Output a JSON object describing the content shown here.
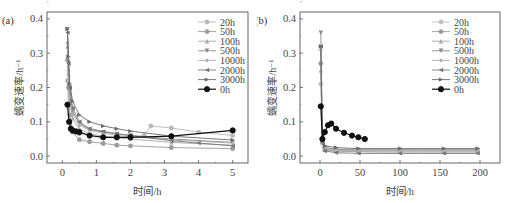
{
  "chart_data": [
    {
      "panel_label": "(a)",
      "type": "line",
      "title": "",
      "xlabel": "时间/h",
      "ylabel": "蠕变速率/h⁻¹",
      "xlim": [
        -0.45,
        5.45
      ],
      "ylim": [
        -0.02,
        0.42
      ],
      "xticks": [
        0,
        1,
        2,
        3,
        4,
        5
      ],
      "xtick_labels": [
        "0",
        "1",
        "2",
        "3",
        "4",
        "5"
      ],
      "yticks": [
        0.0,
        0.1,
        0.2,
        0.3,
        0.4
      ],
      "ytick_labels": [
        "0.0",
        "0.1",
        "0.2",
        "0.3",
        "0.4"
      ],
      "grid": false,
      "legend_position": "upper right",
      "series": [
        {
          "name": "20h",
          "color": "#b8b8b8",
          "marker": "circle",
          "x": [
            0.15,
            0.18,
            0.22,
            0.3,
            0.5,
            0.8,
            1.2,
            1.6,
            2.0,
            2.4,
            2.6,
            3.2,
            4.0,
            5.0
          ],
          "y": [
            0.22,
            0.15,
            0.1,
            0.075,
            0.065,
            0.06,
            0.055,
            0.055,
            0.055,
            0.06,
            0.088,
            0.082,
            0.07,
            0.06
          ]
        },
        {
          "name": "50h",
          "color": "#9a9a9a",
          "marker": "circle",
          "x": [
            0.15,
            0.18,
            0.22,
            0.3,
            0.5,
            0.8,
            1.2,
            1.6,
            2.0,
            3.2,
            5.0
          ],
          "y": [
            0.28,
            0.2,
            0.12,
            0.07,
            0.048,
            0.042,
            0.037,
            0.032,
            0.03,
            0.025,
            0.022
          ]
        },
        {
          "name": "100h",
          "color": "#a8a8a8",
          "marker": "triangle-up",
          "x": [
            0.15,
            0.18,
            0.22,
            0.3,
            0.5,
            0.8,
            1.2,
            1.6,
            2.0,
            3.2,
            5.0
          ],
          "y": [
            0.32,
            0.24,
            0.16,
            0.11,
            0.08,
            0.065,
            0.058,
            0.053,
            0.05,
            0.04,
            0.032
          ]
        },
        {
          "name": "500h",
          "color": "#888888",
          "marker": "triangle-down",
          "x": [
            0.15,
            0.18,
            0.22,
            0.3,
            0.5,
            0.8,
            1.2,
            1.6,
            2.0,
            3.2,
            5.0
          ],
          "y": [
            0.37,
            0.27,
            0.19,
            0.13,
            0.095,
            0.078,
            0.07,
            0.065,
            0.06,
            0.05,
            0.04
          ]
        },
        {
          "name": "1000h",
          "color": "#b0b0b0",
          "marker": "diamond",
          "x": [
            0.15,
            0.18,
            0.22,
            0.3,
            0.5,
            0.8,
            1.2,
            1.6,
            2.0,
            3.2,
            5.0
          ],
          "y": [
            0.33,
            0.25,
            0.17,
            0.12,
            0.09,
            0.075,
            0.067,
            0.06,
            0.057,
            0.047,
            0.038
          ]
        },
        {
          "name": "2000h",
          "color": "#777777",
          "marker": "triangle-left",
          "x": [
            0.15,
            0.18,
            0.22,
            0.3,
            0.5,
            0.8,
            1.2,
            1.6,
            2.0,
            3.2,
            4.0,
            5.0
          ],
          "y": [
            0.36,
            0.27,
            0.2,
            0.14,
            0.1,
            0.08,
            0.072,
            0.065,
            0.06,
            0.045,
            0.038,
            0.03
          ]
        },
        {
          "name": "3000h",
          "color": "#6a6a6a",
          "marker": "triangle-right",
          "x": [
            0.15,
            0.18,
            0.22,
            0.3,
            0.5,
            0.8,
            1.2,
            1.6,
            2.0,
            3.2,
            5.0
          ],
          "y": [
            0.37,
            0.29,
            0.21,
            0.16,
            0.12,
            0.1,
            0.088,
            0.08,
            0.073,
            0.058,
            0.047
          ]
        },
        {
          "name": "0h",
          "color": "#111111",
          "marker": "circle-filled",
          "x": [
            0.15,
            0.2,
            0.25,
            0.3,
            0.4,
            0.5,
            0.8,
            1.2,
            1.6,
            2.0,
            3.2,
            5.0
          ],
          "y": [
            0.15,
            0.1,
            0.08,
            0.075,
            0.072,
            0.07,
            0.06,
            0.055,
            0.055,
            0.055,
            0.058,
            0.075
          ]
        }
      ]
    },
    {
      "panel_label": "(b)",
      "type": "line",
      "title": "",
      "xlabel": "时间/h",
      "ylabel": "蠕变速率/h⁻¹",
      "xlim": [
        -25,
        225
      ],
      "ylim": [
        -0.02,
        0.42
      ],
      "xticks": [
        0,
        50,
        100,
        150,
        200
      ],
      "xtick_labels": [
        "0",
        "50",
        "100",
        "150",
        "200"
      ],
      "yticks": [
        0.0,
        0.1,
        0.2,
        0.3,
        0.4
      ],
      "ytick_labels": [
        "0.0",
        "0.1",
        "0.2",
        "0.3",
        "0.4"
      ],
      "grid": false,
      "legend_position": "upper right",
      "series": [
        {
          "name": "20h",
          "color": "#c0c0c0",
          "marker": "circle",
          "x": [
            1,
            3,
            6,
            20,
            48,
            75,
            100,
            128,
            155,
            180,
            197
          ],
          "y": [
            0.21,
            0.05,
            0.025,
            0.02,
            0.019,
            0.019,
            0.019,
            0.019,
            0.019,
            0.019,
            0.019
          ]
        },
        {
          "name": "50h",
          "color": "#9a9a9a",
          "marker": "circle",
          "x": [
            1,
            3,
            6,
            20,
            48,
            75,
            100,
            128,
            155,
            180,
            197
          ],
          "y": [
            0.27,
            0.04,
            0.018,
            0.014,
            0.013,
            0.012,
            0.012,
            0.012,
            0.012,
            0.012,
            0.012
          ]
        },
        {
          "name": "100h",
          "color": "#a8a8a8",
          "marker": "triangle-up",
          "x": [
            1,
            3,
            6,
            20,
            48,
            75,
            100,
            128,
            155,
            180,
            197
          ],
          "y": [
            0.25,
            0.04,
            0.02,
            0.016,
            0.015,
            0.015,
            0.015,
            0.015,
            0.015,
            0.015,
            0.015
          ]
        },
        {
          "name": "500h",
          "color": "#888888",
          "marker": "triangle-down",
          "x": [
            1,
            3,
            6,
            20,
            48,
            75,
            100,
            128,
            155,
            180,
            197
          ],
          "y": [
            0.36,
            0.05,
            0.025,
            0.02,
            0.018,
            0.018,
            0.018,
            0.018,
            0.018,
            0.018,
            0.018
          ]
        },
        {
          "name": "1000h",
          "color": "#b0b0b0",
          "marker": "diamond",
          "x": [
            1,
            3,
            6,
            20,
            48,
            75,
            100,
            128,
            155,
            180,
            197
          ],
          "y": [
            0.31,
            0.045,
            0.022,
            0.017,
            0.016,
            0.016,
            0.016,
            0.016,
            0.016,
            0.016,
            0.016
          ]
        },
        {
          "name": "2000h",
          "color": "#777777",
          "marker": "triangle-left",
          "x": [
            1,
            3,
            6,
            20,
            48,
            75,
            100,
            128,
            155,
            180,
            197
          ],
          "y": [
            0.32,
            0.04,
            0.015,
            0.01,
            0.008,
            0.008,
            0.008,
            0.008,
            0.008,
            0.008,
            0.008
          ]
        },
        {
          "name": "3000h",
          "color": "#6a6a6a",
          "marker": "triangle-right",
          "x": [
            1,
            3,
            6,
            20,
            48,
            75,
            100,
            128,
            155,
            180,
            197
          ],
          "y": [
            0.32,
            0.05,
            0.03,
            0.025,
            0.022,
            0.022,
            0.022,
            0.022,
            0.022,
            0.022,
            0.022
          ]
        },
        {
          "name": "0h",
          "color": "#111111",
          "marker": "circle-filled",
          "x": [
            1,
            3,
            6,
            10,
            14,
            20,
            30,
            40,
            48,
            56
          ],
          "y": [
            0.145,
            0.05,
            0.07,
            0.09,
            0.095,
            0.08,
            0.068,
            0.06,
            0.055,
            0.05
          ]
        }
      ]
    }
  ]
}
